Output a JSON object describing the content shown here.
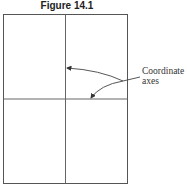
{
  "figure": {
    "title": "Figure 14.1",
    "annotation": {
      "line1": "Coordinate",
      "line2": "axes"
    }
  },
  "colors": {
    "line": "#555555",
    "background": "#ffffff"
  }
}
